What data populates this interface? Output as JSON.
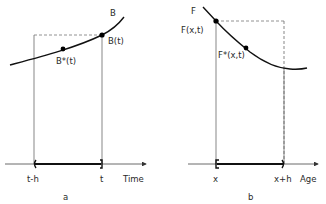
{
  "panel_a": {
    "curve_label": "B",
    "point_end_label": "B(t)",
    "point_mid_label": "B*(t)",
    "tick_left": "t-h",
    "tick_right": "t",
    "axis_label": "Time",
    "panel_label": "a"
  },
  "panel_b": {
    "curve_label": "F",
    "point_start_label": "F(x,t)",
    "point_mid_label": "F*(x,t)",
    "tick_left": "x",
    "tick_right": "x+h",
    "axis_label": "Age",
    "panel_label": "b"
  },
  "footer": {
    "faint_caption": ". . . . . . . . . . . . . . . . . . . . . . . ."
  },
  "colors": {
    "line": "#1a1a1a",
    "thin_line": "#555555",
    "dashed": "#777777"
  }
}
